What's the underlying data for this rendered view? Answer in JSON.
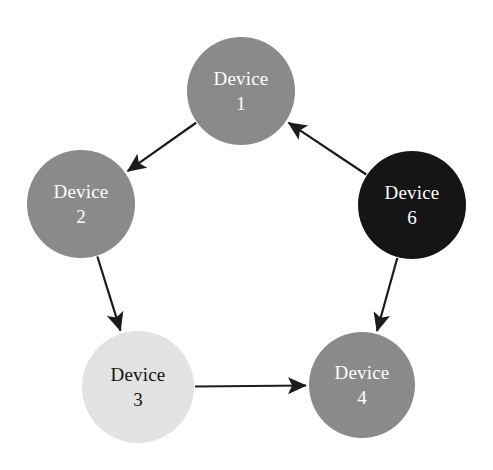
{
  "diagram": {
    "type": "directed-graph",
    "title": "",
    "width": 493,
    "height": 470,
    "background": "#ffffff",
    "nodes": [
      {
        "id": "device1",
        "name": "Device",
        "number": "1",
        "cx": 241,
        "cy": 91,
        "r": 54,
        "fill": "#8a8a8a",
        "text_color": "#ffffff"
      },
      {
        "id": "device2",
        "name": "Device",
        "number": "2",
        "cx": 81,
        "cy": 204,
        "r": 54,
        "fill": "#8a8a8a",
        "text_color": "#ffffff"
      },
      {
        "id": "device3",
        "name": "Device",
        "number": "3",
        "cx": 138,
        "cy": 387,
        "r": 56,
        "fill": "#e2e2e2",
        "text_color": "#111111"
      },
      {
        "id": "device4",
        "name": "Device",
        "number": "4",
        "cx": 362,
        "cy": 385,
        "r": 53,
        "fill": "#8a8a8a",
        "text_color": "#ffffff"
      },
      {
        "id": "device6",
        "name": "Device",
        "number": "6",
        "cx": 412,
        "cy": 205,
        "r": 54,
        "fill": "#151515",
        "text_color": "#ffffff"
      }
    ],
    "edges": [
      {
        "id": "edge-1-to-2",
        "from": "device1",
        "to": "device2",
        "label": "",
        "color": "#1b1b1b",
        "directed": true
      },
      {
        "id": "edge-2-to-3",
        "from": "device2",
        "to": "device3",
        "label": "",
        "color": "#1b1b1b",
        "directed": true
      },
      {
        "id": "edge-3-to-4",
        "from": "device3",
        "to": "device4",
        "label": "",
        "color": "#1b1b1b",
        "directed": true
      },
      {
        "id": "edge-6-to-4",
        "from": "device6",
        "to": "device4",
        "label": "",
        "color": "#1b1b1b",
        "directed": true
      },
      {
        "id": "edge-6-to-1",
        "from": "device6",
        "to": "device1",
        "label": "",
        "color": "#1b1b1b",
        "directed": true
      }
    ]
  }
}
